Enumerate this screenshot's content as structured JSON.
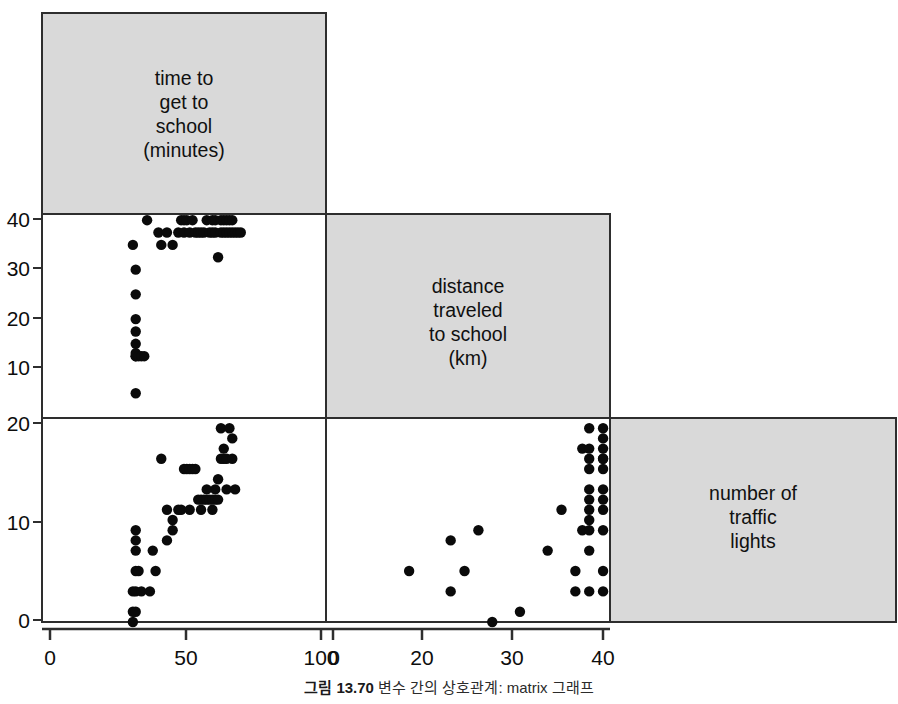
{
  "figure": {
    "caption_number": "그림 13.70",
    "caption_text": "변수 간의 상호관계: matrix 그래프"
  },
  "chart_data": {
    "type": "scatter",
    "title": "",
    "subtitle": "",
    "layout": "scatterplot-matrix",
    "grid": false,
    "legend_position": "none",
    "variables": [
      {
        "key": "time",
        "label": "time to\nget to\nschool\n(minutes)",
        "label_lines": [
          "time to",
          "get to",
          "school",
          "(minutes)"
        ],
        "unit": "minutes",
        "axis_range": [
          0,
          100
        ],
        "x_ticks": [
          0,
          50,
          100
        ],
        "y_ticks": [
          10,
          20,
          30,
          40
        ]
      },
      {
        "key": "distance",
        "label": "distance\ntraveled\nto school\n(km)",
        "label_lines": [
          "distance",
          "traveled",
          "to school",
          "(km)"
        ],
        "unit": "km",
        "axis_range": [
          0,
          41
        ],
        "x_ticks": [
          0,
          10,
          20,
          30,
          40
        ],
        "y_ticks": [
          10,
          20,
          30,
          40
        ]
      },
      {
        "key": "lights",
        "label": "number of\ntraffic\nlights",
        "label_lines": [
          "number of",
          "traffic",
          "lights"
        ],
        "unit": "",
        "axis_range": [
          0,
          20
        ],
        "x_ticks": [],
        "y_ticks": [
          0,
          10,
          20
        ]
      }
    ],
    "panels": [
      {
        "row": 1,
        "col": 0,
        "xvar": "time",
        "yvar": "distance",
        "xlabel": "time to get to school (minutes)",
        "ylabel": "distance traveled to school (km)",
        "xlim": [
          0,
          100
        ],
        "ylim": [
          8,
          41
        ],
        "points": [
          [
            32,
            36
          ],
          [
            33,
            18
          ],
          [
            33,
            18
          ],
          [
            33,
            18.5
          ],
          [
            33,
            20
          ],
          [
            33,
            22
          ],
          [
            33,
            24
          ],
          [
            33,
            28
          ],
          [
            33,
            32
          ],
          [
            33,
            12
          ],
          [
            34,
            18
          ],
          [
            35,
            18
          ],
          [
            36,
            18
          ],
          [
            37,
            40
          ],
          [
            41,
            38
          ],
          [
            42,
            36
          ],
          [
            44,
            38
          ],
          [
            46,
            36
          ],
          [
            48,
            38
          ],
          [
            49,
            40
          ],
          [
            50,
            40
          ],
          [
            50,
            38
          ],
          [
            51,
            40
          ],
          [
            52,
            38
          ],
          [
            53,
            40
          ],
          [
            54,
            38
          ],
          [
            55,
            38
          ],
          [
            56,
            38
          ],
          [
            57,
            38
          ],
          [
            58,
            40
          ],
          [
            59,
            38
          ],
          [
            60,
            40
          ],
          [
            60,
            38
          ],
          [
            61,
            40
          ],
          [
            61,
            38
          ],
          [
            62,
            34
          ],
          [
            63,
            40
          ],
          [
            63,
            38
          ],
          [
            64,
            40
          ],
          [
            64,
            38
          ],
          [
            65,
            40
          ],
          [
            65,
            38
          ],
          [
            66,
            40
          ],
          [
            66,
            38
          ],
          [
            67,
            40
          ],
          [
            67,
            38
          ],
          [
            68,
            38
          ],
          [
            69,
            38
          ],
          [
            70,
            38
          ]
        ]
      },
      {
        "row": 2,
        "col": 0,
        "xvar": "time",
        "yvar": "lights",
        "xlabel": "time to get to school (minutes)",
        "ylabel": "number of traffic lights",
        "xlim": [
          0,
          100
        ],
        "ylim": [
          0,
          20
        ],
        "points": [
          [
            32,
            0
          ],
          [
            32,
            1
          ],
          [
            33,
            1
          ],
          [
            32,
            3
          ],
          [
            33,
            3
          ],
          [
            35,
            3
          ],
          [
            38,
            3
          ],
          [
            33,
            5
          ],
          [
            34,
            5
          ],
          [
            40,
            5
          ],
          [
            33,
            7
          ],
          [
            33,
            8
          ],
          [
            33,
            9
          ],
          [
            39,
            7
          ],
          [
            44,
            8
          ],
          [
            46,
            9
          ],
          [
            44,
            11
          ],
          [
            48,
            11
          ],
          [
            49,
            11
          ],
          [
            50,
            15
          ],
          [
            51,
            15
          ],
          [
            52,
            15
          ],
          [
            53,
            15
          ],
          [
            54,
            15
          ],
          [
            55,
            12
          ],
          [
            56,
            11
          ],
          [
            56,
            12
          ],
          [
            57,
            12
          ],
          [
            58,
            12
          ],
          [
            59,
            12
          ],
          [
            60,
            12
          ],
          [
            60,
            11
          ],
          [
            61,
            12
          ],
          [
            61,
            13
          ],
          [
            62,
            12
          ],
          [
            62,
            14
          ],
          [
            63,
            16
          ],
          [
            63,
            19
          ],
          [
            64,
            16
          ],
          [
            64,
            17
          ],
          [
            65,
            16
          ],
          [
            65,
            13
          ],
          [
            66,
            19
          ],
          [
            67,
            18
          ],
          [
            67,
            16
          ],
          [
            68,
            13
          ],
          [
            42,
            16
          ],
          [
            46,
            10
          ],
          [
            52,
            11
          ],
          [
            58,
            13
          ]
        ]
      },
      {
        "row": 2,
        "col": 1,
        "xvar": "distance",
        "yvar": "lights",
        "xlabel": "distance traveled to school (km)",
        "ylabel": "number of traffic lights",
        "xlim": [
          0,
          41
        ],
        "ylim": [
          0,
          20
        ],
        "points": [
          [
            12,
            5
          ],
          [
            18,
            8
          ],
          [
            18,
            3
          ],
          [
            20,
            5
          ],
          [
            22,
            9
          ],
          [
            24,
            0
          ],
          [
            28,
            1
          ],
          [
            32,
            7
          ],
          [
            34,
            11
          ],
          [
            36,
            3
          ],
          [
            36,
            5
          ],
          [
            37,
            9
          ],
          [
            38,
            3
          ],
          [
            38,
            7
          ],
          [
            38,
            9
          ],
          [
            38,
            10
          ],
          [
            38,
            11
          ],
          [
            38,
            12
          ],
          [
            38,
            13
          ],
          [
            38,
            15
          ],
          [
            38,
            16
          ],
          [
            37,
            17
          ],
          [
            38,
            17
          ],
          [
            40,
            3
          ],
          [
            40,
            5
          ],
          [
            40,
            9
          ],
          [
            40,
            11
          ],
          [
            40,
            12
          ],
          [
            40,
            13
          ],
          [
            40,
            15
          ],
          [
            40,
            16
          ],
          [
            40,
            17
          ],
          [
            40,
            18
          ],
          [
            40,
            19
          ],
          [
            40,
            16
          ],
          [
            38,
            19
          ]
        ]
      }
    ],
    "diagonal_cells": [
      {
        "row": 0,
        "col": 0,
        "var": "time"
      },
      {
        "row": 1,
        "col": 1,
        "var": "distance"
      },
      {
        "row": 2,
        "col": 2,
        "var": "lights"
      }
    ],
    "axis_tick_labels": {
      "left_middle": [
        "40",
        "30",
        "20",
        "10"
      ],
      "left_bottom": [
        "20",
        "10",
        "0"
      ],
      "bottom_left_panel": [
        "0",
        "50",
        "100"
      ],
      "bottom_middle_panel": [
        "0",
        "10",
        "20",
        "30",
        "40"
      ]
    }
  },
  "colors": {
    "panel_fill": "#d9d9d9",
    "panel_border": "#2e2e2e",
    "point": "#0a0a0a",
    "background": "#ffffff",
    "text": "#101010"
  }
}
